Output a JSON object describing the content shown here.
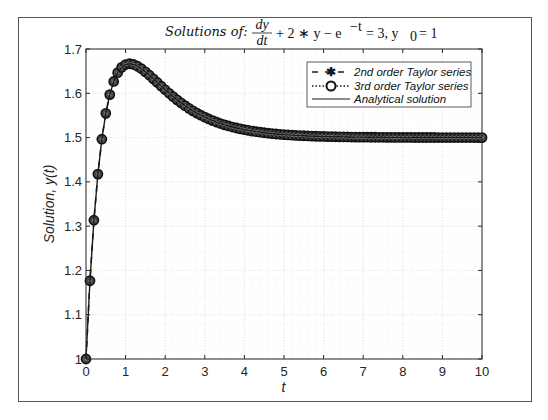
{
  "figure": {
    "title_prefix": "Solutions of:",
    "title_frac_num": "dy",
    "title_frac_den": "dt",
    "title_rest": "+ 2 ∗ y − e",
    "title_exp": "−t",
    "title_tail": "= 3, y",
    "title_sub": "0",
    "title_end": "= 1",
    "xlabel": "t",
    "ylabel": "Solution, y(t)"
  },
  "legend": {
    "items": [
      {
        "label": "2nd order Taylor series",
        "style": "dashed-asterisk"
      },
      {
        "label": "3rd order Taylor series",
        "style": "dotted-circle"
      },
      {
        "label": "Analytical solution",
        "style": "solid"
      }
    ]
  },
  "axes": {
    "xticks": [
      "0",
      "1",
      "2",
      "3",
      "4",
      "5",
      "6",
      "7",
      "8",
      "9",
      "10"
    ],
    "yticks": [
      "1",
      "1.1",
      "1.2",
      "1.3",
      "1.4",
      "1.5",
      "1.6",
      "1.7"
    ]
  },
  "colors": {
    "line": "#1a1a1a",
    "marker_fill": "#3c3c3c",
    "marker_edge": "#111111",
    "grid": "#e6e6e6",
    "axis": "#262626"
  },
  "chart_data": {
    "type": "line",
    "xlabel": "t",
    "ylabel": "Solution, y(t)",
    "xlim": [
      0,
      10
    ],
    "ylim": [
      1,
      1.7
    ],
    "grid": "major and minor (dotted)",
    "legend_position": "upper right",
    "x": [
      0,
      0.1,
      0.2,
      0.3,
      0.4,
      0.5,
      0.6,
      0.7,
      0.8,
      0.9,
      1.0,
      1.1,
      1.2,
      1.3,
      1.4,
      1.5,
      1.6,
      1.7,
      1.8,
      1.9,
      2.0,
      2.1,
      2.2,
      2.3,
      2.4,
      2.5,
      2.6,
      2.7,
      2.8,
      2.9,
      3.0,
      3.1,
      3.2,
      3.3,
      3.4,
      3.5,
      3.6,
      3.7,
      3.8,
      3.9,
      4.0,
      4.1,
      4.2,
      4.3,
      4.4,
      4.5,
      4.6,
      4.7,
      4.8,
      4.9,
      5.0,
      5.1,
      5.2,
      5.3,
      5.4,
      5.5,
      5.6,
      5.7,
      5.8,
      5.9,
      6.0,
      6.1,
      6.2,
      6.3,
      6.4,
      6.5,
      6.6,
      6.7,
      6.8,
      6.9,
      7.0,
      7.1,
      7.2,
      7.3,
      7.4,
      7.5,
      7.6,
      7.7,
      7.8,
      7.9,
      8.0,
      8.1,
      8.2,
      8.3,
      8.4,
      8.5,
      8.6,
      8.7,
      8.8,
      8.9,
      9.0,
      9.1,
      9.2,
      9.3,
      9.4,
      9.5,
      9.6,
      9.7,
      9.8,
      9.9,
      10.0
    ],
    "series": [
      {
        "name": "2nd order Taylor series",
        "values": [
          1.0,
          1.1767,
          1.3133,
          1.4176,
          1.4963,
          1.5547,
          1.597,
          1.6267,
          1.6465,
          1.6586,
          1.6649,
          1.6667,
          1.6651,
          1.6611,
          1.6554,
          1.6484,
          1.6408,
          1.6326,
          1.6243,
          1.616,
          1.6079,
          1.6,
          1.5924,
          1.5852,
          1.5784,
          1.572,
          1.566,
          1.5604,
          1.5553,
          1.5505,
          1.5461,
          1.542,
          1.5383,
          1.5348,
          1.5317,
          1.5288,
          1.5262,
          1.5238,
          1.5216,
          1.5196,
          1.5178,
          1.5162,
          1.5147,
          1.5133,
          1.5121,
          1.5109,
          1.5099,
          1.509,
          1.5081,
          1.5074,
          1.5067,
          1.506,
          1.5055,
          1.505,
          1.5045,
          1.5041,
          1.5037,
          1.5033,
          1.503,
          1.5027,
          1.5025,
          1.5022,
          1.502,
          1.5018,
          1.5017,
          1.5015,
          1.5014,
          1.5012,
          1.5011,
          1.501,
          1.5009,
          1.5008,
          1.5007,
          1.5007,
          1.5006,
          1.5006,
          1.5005,
          1.5005,
          1.5004,
          1.5004,
          1.5003,
          1.5003,
          1.5003,
          1.5002,
          1.5002,
          1.5002,
          1.5002,
          1.5002,
          1.5002,
          1.5001,
          1.5001,
          1.5001,
          1.5001,
          1.5001,
          1.5001,
          1.5001,
          1.5001,
          1.5001,
          1.5001,
          1.5,
          1.5
        ]
      },
      {
        "name": "3rd order Taylor series",
        "values": [
          1.0,
          1.1767,
          1.3133,
          1.4176,
          1.4963,
          1.5547,
          1.597,
          1.6267,
          1.6465,
          1.6586,
          1.6649,
          1.6667,
          1.6651,
          1.6611,
          1.6554,
          1.6484,
          1.6408,
          1.6326,
          1.6243,
          1.616,
          1.6079,
          1.6,
          1.5924,
          1.5852,
          1.5784,
          1.572,
          1.566,
          1.5604,
          1.5553,
          1.5505,
          1.5461,
          1.542,
          1.5383,
          1.5348,
          1.5317,
          1.5288,
          1.5262,
          1.5238,
          1.5216,
          1.5196,
          1.5178,
          1.5162,
          1.5147,
          1.5133,
          1.5121,
          1.5109,
          1.5099,
          1.509,
          1.5081,
          1.5074,
          1.5067,
          1.506,
          1.5055,
          1.505,
          1.5045,
          1.5041,
          1.5037,
          1.5033,
          1.503,
          1.5027,
          1.5025,
          1.5022,
          1.502,
          1.5018,
          1.5017,
          1.5015,
          1.5014,
          1.5012,
          1.5011,
          1.501,
          1.5009,
          1.5008,
          1.5007,
          1.5007,
          1.5006,
          1.5006,
          1.5005,
          1.5005,
          1.5004,
          1.5004,
          1.5003,
          1.5003,
          1.5003,
          1.5002,
          1.5002,
          1.5002,
          1.5002,
          1.5002,
          1.5002,
          1.5001,
          1.5001,
          1.5001,
          1.5001,
          1.5001,
          1.5001,
          1.5001,
          1.5001,
          1.5001,
          1.5001,
          1.5,
          1.5
        ]
      },
      {
        "name": "Analytical solution",
        "values": [
          1.0,
          1.1767,
          1.3133,
          1.4176,
          1.4963,
          1.5547,
          1.597,
          1.6267,
          1.6465,
          1.6586,
          1.6649,
          1.6667,
          1.6651,
          1.6611,
          1.6554,
          1.6484,
          1.6408,
          1.6326,
          1.6243,
          1.616,
          1.6079,
          1.6,
          1.5924,
          1.5852,
          1.5784,
          1.572,
          1.566,
          1.5604,
          1.5553,
          1.5505,
          1.5461,
          1.542,
          1.5383,
          1.5348,
          1.5317,
          1.5288,
          1.5262,
          1.5238,
          1.5216,
          1.5196,
          1.5178,
          1.5162,
          1.5147,
          1.5133,
          1.5121,
          1.5109,
          1.5099,
          1.509,
          1.5081,
          1.5074,
          1.5067,
          1.506,
          1.5055,
          1.505,
          1.5045,
          1.5041,
          1.5037,
          1.5033,
          1.503,
          1.5027,
          1.5025,
          1.5022,
          1.502,
          1.5018,
          1.5017,
          1.5015,
          1.5014,
          1.5012,
          1.5011,
          1.501,
          1.5009,
          1.5008,
          1.5007,
          1.5007,
          1.5006,
          1.5006,
          1.5005,
          1.5005,
          1.5004,
          1.5004,
          1.5003,
          1.5003,
          1.5003,
          1.5002,
          1.5002,
          1.5002,
          1.5002,
          1.5002,
          1.5002,
          1.5001,
          1.5001,
          1.5001,
          1.5001,
          1.5001,
          1.5001,
          1.5001,
          1.5001,
          1.5001,
          1.5001,
          1.5,
          1.5
        ]
      }
    ]
  }
}
